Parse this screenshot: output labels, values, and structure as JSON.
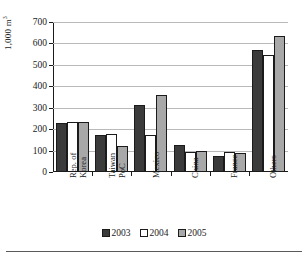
{
  "chart_data": {
    "type": "bar",
    "title": "",
    "subtitle": "",
    "xlabel": "",
    "ylabel": "1,000 m³",
    "ylabel_text": "1,000 m",
    "ylabel_superscript": "3",
    "ylim": [
      0,
      700
    ],
    "ytick_step": 100,
    "yticks": [
      0,
      100,
      200,
      300,
      400,
      500,
      600,
      700
    ],
    "ytick_labels": [
      "0",
      "100",
      "200",
      "300",
      "400",
      "500",
      "600",
      "700"
    ],
    "grid": true,
    "grid_axis": "y",
    "legend_position": "bottom-center",
    "categories": [
      "Rep. of Korea",
      "Taiwan PoC",
      "Mexico",
      "China",
      "France",
      "Others"
    ],
    "category_lines": [
      [
        "Rep. of",
        "Korea"
      ],
      [
        "Taiwan",
        "PoC"
      ],
      [
        "Mexico",
        ""
      ],
      [
        "China",
        ""
      ],
      [
        "France",
        ""
      ],
      [
        "Others",
        ""
      ]
    ],
    "series": [
      {
        "name": "2003",
        "color": "#3b3b3b",
        "values": [
          228,
          172,
          313,
          126,
          73,
          570
        ]
      },
      {
        "name": "2004",
        "color": "#ffffff",
        "values": [
          235,
          178,
          175,
          95,
          92,
          547
        ]
      },
      {
        "name": "2005",
        "color": "#a8a8a8",
        "values": [
          235,
          120,
          358,
          96,
          88,
          633
        ]
      }
    ]
  },
  "legend": {
    "items": [
      {
        "label": "2003",
        "color": "#3b3b3b"
      },
      {
        "label": "2004",
        "color": "#ffffff"
      },
      {
        "label": "2005",
        "color": "#a8a8a8"
      }
    ]
  }
}
